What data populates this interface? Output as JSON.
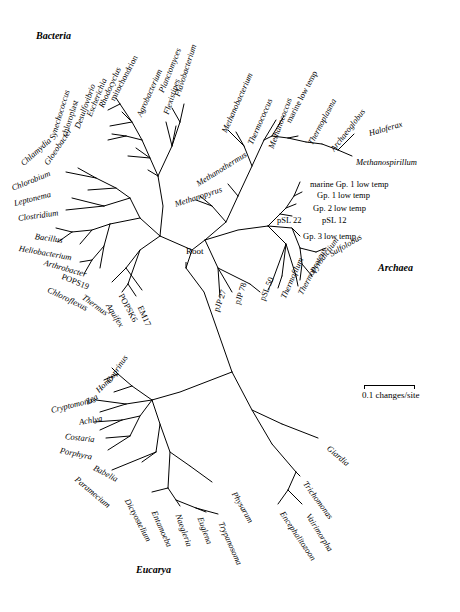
{
  "figure": {
    "domains": [
      {
        "name": "Bacteria",
        "x": 36,
        "y": 36
      },
      {
        "name": "Archaea",
        "x": 378,
        "y": 268
      },
      {
        "name": "Eucarya",
        "x": 136,
        "y": 570
      }
    ],
    "root": {
      "label": "Root",
      "x": 186,
      "y": 252
    },
    "scale": {
      "label": "0.1 changes/site",
      "x": 362,
      "y": 393,
      "bar_x": 364,
      "bar_y": 385,
      "bar_width": 50
    },
    "taxa": [
      {
        "name": "mitochondrion",
        "x": 112,
        "y": 96,
        "rot": -62,
        "italic": false
      },
      {
        "name": "Rhodocyclus",
        "x": 101,
        "y": 103,
        "rot": -66,
        "italic": true
      },
      {
        "name": "Escherichia",
        "x": 89,
        "y": 112,
        "rot": -68,
        "italic": true
      },
      {
        "name": "Desulfovibrio",
        "x": 77,
        "y": 124,
        "rot": -70,
        "italic": true
      },
      {
        "name": "chloroplast",
        "x": 64,
        "y": 132,
        "rot": -72,
        "italic": false
      },
      {
        "name": "Synechococcus",
        "x": 52,
        "y": 135,
        "rot": -73,
        "italic": true
      },
      {
        "name": "Gloeobacter",
        "x": 46,
        "y": 160,
        "rot": -56,
        "italic": true
      },
      {
        "name": "Chlamydia",
        "x": 22,
        "y": 160,
        "rot": -42,
        "italic": true
      },
      {
        "name": "Chlorobium",
        "x": 12,
        "y": 184,
        "rot": -22,
        "italic": true
      },
      {
        "name": "Leptonema",
        "x": 14,
        "y": 199,
        "rot": -14,
        "italic": true
      },
      {
        "name": "Clostridium",
        "x": 18,
        "y": 214,
        "rot": -8,
        "italic": true
      },
      {
        "name": "Bacillus",
        "x": 35,
        "y": 232,
        "rot": 8,
        "italic": true
      },
      {
        "name": "Heliobacterium",
        "x": 19,
        "y": 244,
        "rot": 10,
        "italic": true
      },
      {
        "name": "Arthrobacter",
        "x": 44,
        "y": 258,
        "rot": 16,
        "italic": true
      },
      {
        "name": "POPS19",
        "x": 62,
        "y": 272,
        "rot": 22,
        "italic": false
      },
      {
        "name": "Chloroflexus",
        "x": 48,
        "y": 285,
        "rot": 26,
        "italic": true
      },
      {
        "name": "Thermus",
        "x": 83,
        "y": 292,
        "rot": 36,
        "italic": true
      },
      {
        "name": "Aquifex",
        "x": 108,
        "y": 300,
        "rot": 58,
        "italic": true
      },
      {
        "name": "POPSK6",
        "x": 121,
        "y": 290,
        "rot": 62,
        "italic": false
      },
      {
        "name": "EM17",
        "x": 140,
        "y": 302,
        "rot": 66,
        "italic": false
      },
      {
        "name": "pJP 27",
        "x": 216,
        "y": 307,
        "rot": -70,
        "italic": false
      },
      {
        "name": "pJP 78",
        "x": 237,
        "y": 300,
        "rot": -72,
        "italic": false
      },
      {
        "name": "pSL 50",
        "x": 262,
        "y": 296,
        "rot": -68,
        "italic": false
      },
      {
        "name": "Thermofilum",
        "x": 283,
        "y": 294,
        "rot": -66,
        "italic": true
      },
      {
        "name": "Thermoproteus",
        "x": 300,
        "y": 290,
        "rot": -62,
        "italic": true
      },
      {
        "name": "Pyrodictium",
        "x": 312,
        "y": 268,
        "rot": -54,
        "italic": true
      },
      {
        "name": "Sulfolobus",
        "x": 330,
        "y": 250,
        "rot": -30,
        "italic": true
      },
      {
        "name": "Gp. 3 low temp",
        "x": 303,
        "y": 232,
        "rot": 0,
        "italic": false
      },
      {
        "name": "pSL 22",
        "x": 277,
        "y": 216,
        "rot": 0,
        "italic": false
      },
      {
        "name": "pSL 12",
        "x": 322,
        "y": 216,
        "rot": 0,
        "italic": false
      },
      {
        "name": "Gp. 2 low temp",
        "x": 313,
        "y": 204,
        "rot": 0,
        "italic": false
      },
      {
        "name": "Gp. 1 low temp",
        "x": 317,
        "y": 191,
        "rot": 0,
        "italic": false
      },
      {
        "name": "marine Gp. 1 low temp",
        "x": 310,
        "y": 180,
        "rot": 0,
        "italic": false
      },
      {
        "name": "Methanospirillum",
        "x": 356,
        "y": 158,
        "rot": 0,
        "italic": true
      },
      {
        "name": "Haloferax",
        "x": 369,
        "y": 129,
        "rot": -16,
        "italic": true
      },
      {
        "name": "Archaeoglobus",
        "x": 332,
        "y": 146,
        "rot": -52,
        "italic": true
      },
      {
        "name": "Thermoplasma",
        "x": 310,
        "y": 140,
        "rot": -62,
        "italic": true
      },
      {
        "name": "marine low temp",
        "x": 288,
        "y": 118,
        "rot": -62,
        "italic": false
      },
      {
        "name": "Methanococcus",
        "x": 271,
        "y": 144,
        "rot": -70,
        "italic": true
      },
      {
        "name": "Thermococcus",
        "x": 250,
        "y": 140,
        "rot": -66,
        "italic": true
      },
      {
        "name": "Methanobacterium",
        "x": 224,
        "y": 128,
        "rot": -66,
        "italic": true
      },
      {
        "name": "Methanothermus",
        "x": 197,
        "y": 180,
        "rot": -32,
        "italic": true
      },
      {
        "name": "Methanopyrus",
        "x": 175,
        "y": 200,
        "rot": -18,
        "italic": true
      },
      {
        "name": "Flavobacterium",
        "x": 177,
        "y": 92,
        "rot": -72,
        "italic": true
      },
      {
        "name": "Flexistipes",
        "x": 166,
        "y": 110,
        "rot": -72,
        "italic": true
      },
      {
        "name": "Planctomyces",
        "x": 161,
        "y": 88,
        "rot": -68,
        "italic": true
      },
      {
        "name": "Agrobacterium",
        "x": 139,
        "y": 112,
        "rot": -66,
        "italic": true
      },
      {
        "name": "Coprinus",
        "x": 108,
        "y": 378,
        "rot": -56,
        "italic": true
      },
      {
        "name": "Homo",
        "x": 97,
        "y": 387,
        "rot": -44,
        "italic": true
      },
      {
        "name": "Zea",
        "x": 86,
        "y": 398,
        "rot": -30,
        "italic": true
      },
      {
        "name": "Cryptomonas",
        "x": 51,
        "y": 406,
        "rot": -14,
        "italic": true
      },
      {
        "name": "Achlya",
        "x": 79,
        "y": 418,
        "rot": -10,
        "italic": true
      },
      {
        "name": "Costaria",
        "x": 65,
        "y": 432,
        "rot": 6,
        "italic": true
      },
      {
        "name": "Porphyra",
        "x": 60,
        "y": 446,
        "rot": 12,
        "italic": true
      },
      {
        "name": "Babelia",
        "x": 94,
        "y": 463,
        "rot": 28,
        "italic": true
      },
      {
        "name": "Paramecium",
        "x": 76,
        "y": 474,
        "rot": 40,
        "italic": true
      },
      {
        "name": "Dictyostelium",
        "x": 127,
        "y": 495,
        "rot": 62,
        "italic": true
      },
      {
        "name": "Entamoeba",
        "x": 154,
        "y": 507,
        "rot": 66,
        "italic": true
      },
      {
        "name": "Naegleria",
        "x": 178,
        "y": 510,
        "rot": 70,
        "italic": true
      },
      {
        "name": "Euglena",
        "x": 200,
        "y": 513,
        "rot": 70,
        "italic": true
      },
      {
        "name": "Trypanosoma",
        "x": 221,
        "y": 518,
        "rot": 66,
        "italic": true
      },
      {
        "name": "Physarum",
        "x": 234,
        "y": 488,
        "rot": 60,
        "italic": true
      },
      {
        "name": "Encephalitozoon",
        "x": 282,
        "y": 508,
        "rot": 56,
        "italic": true
      },
      {
        "name": "Vairimorpha",
        "x": 308,
        "y": 510,
        "rot": 58,
        "italic": true
      },
      {
        "name": "Trichomonas",
        "x": 305,
        "y": 478,
        "rot": 54,
        "italic": true
      },
      {
        "name": "Giardia",
        "x": 328,
        "y": 443,
        "rot": 40,
        "italic": true
      }
    ]
  }
}
